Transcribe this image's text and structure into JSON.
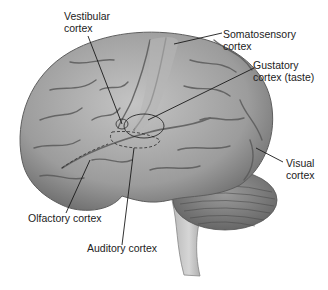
{
  "diagram": {
    "labels": [
      {
        "id": "vestibular",
        "text": "Vestibular\ncortex"
      },
      {
        "id": "somatosensory",
        "text": "Somatosensory\ncortex"
      },
      {
        "id": "gustatory",
        "text": "Gustatory\ncortex (taste)"
      },
      {
        "id": "visual",
        "text": "Visual\ncortex"
      },
      {
        "id": "olfactory",
        "text": "Olfactory cortex"
      },
      {
        "id": "auditory",
        "text": "Auditory cortex"
      }
    ],
    "colors": {
      "brain_fill": "#a9a9a9",
      "brain_dark": "#6e6e6e",
      "sulci": "#5a5a5a",
      "leader_line": "#1a1a1a",
      "text": "#222222"
    }
  }
}
